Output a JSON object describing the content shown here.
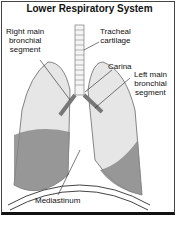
{
  "title": "Lower Respiratory System",
  "labels": {
    "right_main": "Right main\nbronchial\nsegment",
    "trachea": "Tracheal\ncartilage",
    "carina": "Carina",
    "left_main": "Left main\nbronchial\nsegment",
    "mediastinum": "Mediastinum"
  }
}
